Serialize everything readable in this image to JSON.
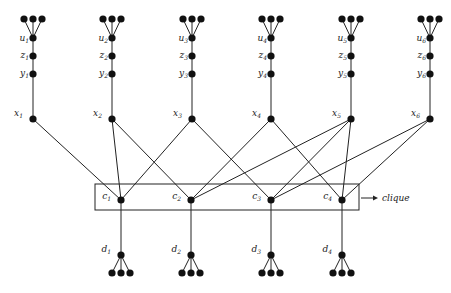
{
  "diagram": {
    "title": "",
    "clique_label": "clique",
    "columns": [
      {
        "id": 1,
        "x": 33
      },
      {
        "id": 2,
        "x": 112
      },
      {
        "id": 3,
        "x": 192
      },
      {
        "id": 4,
        "x": 271
      },
      {
        "id": 5,
        "x": 351
      },
      {
        "id": 6,
        "x": 430
      }
    ],
    "column_rows": {
      "leaves_y": 19,
      "leaf_dx": 9,
      "u_y": 38,
      "z_y": 56,
      "y_y": 74,
      "x_y": 119
    },
    "top_nodes": [
      {
        "col": 1,
        "labels": {
          "u": "u",
          "z": "z",
          "y": "y",
          "x": "x"
        },
        "index": "1"
      },
      {
        "col": 2,
        "labels": {
          "u": "u",
          "z": "z",
          "y": "y",
          "x": "x"
        },
        "index": "2"
      },
      {
        "col": 3,
        "labels": {
          "u": "u",
          "z": "z",
          "y": "y",
          "x": "x"
        },
        "index": "3"
      },
      {
        "col": 4,
        "labels": {
          "u": "u",
          "z": "z",
          "y": "y",
          "x": "x"
        },
        "index": "4"
      },
      {
        "col": 5,
        "labels": {
          "u": "u",
          "z": "z",
          "y": "y",
          "x": "x"
        },
        "index": "5"
      },
      {
        "col": 6,
        "labels": {
          "u": "u",
          "z": "z",
          "y": "y",
          "x": "x"
        },
        "index": "6"
      }
    ],
    "clique_nodes": [
      {
        "id": "c1",
        "base": "c",
        "index": "1",
        "x": 121,
        "y": 200,
        "neighbors": [
          "x1",
          "x2",
          "x3"
        ]
      },
      {
        "id": "c2",
        "base": "c",
        "index": "2",
        "x": 191,
        "y": 200,
        "neighbors": [
          "x2",
          "x4",
          "x5"
        ]
      },
      {
        "id": "c3",
        "base": "c",
        "index": "3",
        "x": 271,
        "y": 200,
        "neighbors": [
          "x3",
          "x5",
          "x6"
        ]
      },
      {
        "id": "c4",
        "base": "c",
        "index": "4",
        "x": 342,
        "y": 200,
        "neighbors": [
          "x4",
          "x5",
          "x6"
        ]
      }
    ],
    "bottom_nodes": [
      {
        "id": "d1",
        "base": "d",
        "index": "1",
        "x": 121,
        "y": 255
      },
      {
        "id": "d2",
        "base": "d",
        "index": "2",
        "x": 191,
        "y": 255
      },
      {
        "id": "d3",
        "base": "d",
        "index": "3",
        "x": 271,
        "y": 255
      },
      {
        "id": "d4",
        "base": "d",
        "index": "4",
        "x": 342,
        "y": 255
      }
    ],
    "bottom_leaves_y": 273,
    "clique_box": {
      "x": 95,
      "y": 184,
      "width": 264,
      "height": 26
    },
    "clique_arrow": {
      "x1": 361,
      "y1": 198,
      "x2": 378,
      "y2": 198
    },
    "clique_text_pos": {
      "x": 382,
      "y": 201
    },
    "colors": {
      "line": "#222222",
      "node": "#111111",
      "background": "#ffffff"
    }
  }
}
